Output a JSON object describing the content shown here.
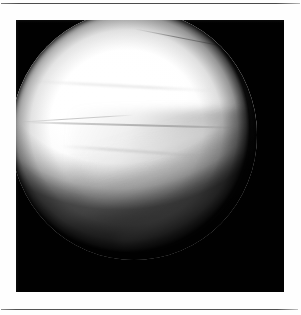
{
  "page": {
    "background_color": "#fefefe",
    "rules": [
      {
        "name": "top-rule",
        "color": "#4c4c4c",
        "y": 3
      },
      {
        "name": "bottom-rule",
        "color": "#515151",
        "y": 309
      }
    ]
  },
  "figure": {
    "panel": {
      "background_color": "#010101",
      "x": 16,
      "y": 20,
      "width": 268,
      "height": 272
    },
    "scope_view": {
      "shape": "circle",
      "center_x": 134,
      "center_y": 133,
      "diameter": 246,
      "bright_tissue_color": "#ffffff",
      "mid_tissue_color": "#e2e2e2",
      "dark_tissue_color": "#3a3a3a",
      "surround_color": "#010101",
      "features": [
        "bright-cartilage-dome-upper-left",
        "grey-soft-tissue-wedge-lower-right",
        "thin-dark-crease-upper-right",
        "thin-dark-crease-midline",
        "diagonal-fibre-striations-lower-right",
        "dark-rim-vignette"
      ]
    }
  },
  "captions": {
    "text": ""
  }
}
